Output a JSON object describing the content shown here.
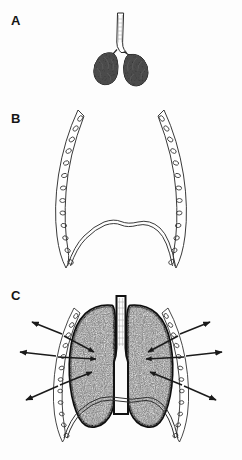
{
  "figure": {
    "background_color": "#fdfdfd",
    "ink_color": "#222222",
    "width": 242,
    "height": 460,
    "panels": [
      {
        "id": "A",
        "label": "A",
        "caption": "Collapsed lungs with trachea, outside the thorax",
        "label_x": 11,
        "label_y": 14,
        "elements": [
          {
            "name": "trachea",
            "shading": "light-outline"
          },
          {
            "name": "left-lung-collapsed",
            "shading": "dark-mottled"
          },
          {
            "name": "right-lung-collapsed",
            "shading": "dark-mottled"
          }
        ]
      },
      {
        "id": "B",
        "label": "B",
        "caption": "Empty thoracic cage with ribs and diaphragm",
        "label_x": 11,
        "label_y": 112,
        "elements": [
          {
            "name": "left-rib-cage",
            "shading": "outline-with-rib-ovals",
            "rib_count": 12
          },
          {
            "name": "right-rib-cage",
            "shading": "outline-with-rib-ovals",
            "rib_count": 12
          },
          {
            "name": "diaphragm",
            "shading": "double-line-dome"
          }
        ]
      },
      {
        "id": "C",
        "label": "C",
        "caption": "Inflated lungs filling the thoracic cage, arrows show expansion",
        "label_x": 11,
        "label_y": 289,
        "arrow_count": 6,
        "arrow_style": "double-headed",
        "elements": [
          {
            "name": "trachea",
            "shading": "light-outline"
          },
          {
            "name": "left-lung-inflated",
            "shading": "stippled-grey"
          },
          {
            "name": "right-lung-inflated",
            "shading": "stippled-grey"
          },
          {
            "name": "pleural-outline",
            "shading": "thick-black"
          },
          {
            "name": "left-rib-cage",
            "shading": "outline-with-rib-ovals"
          },
          {
            "name": "right-rib-cage",
            "shading": "outline-with-rib-ovals"
          },
          {
            "name": "diaphragm",
            "shading": "double-line-dome"
          },
          {
            "name": "expansion-arrows",
            "shading": "solid-black"
          }
        ]
      }
    ]
  }
}
